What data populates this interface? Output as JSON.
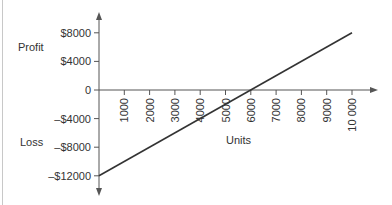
{
  "chart_data": {
    "type": "line",
    "title": "",
    "xlabel": "Units",
    "ylabel_top": "Profit",
    "ylabel_bottom": "Loss",
    "x_ticks": [
      1000,
      2000,
      3000,
      4000,
      5000,
      6000,
      7000,
      8000,
      9000,
      10000
    ],
    "x_tick_labels": [
      "1000",
      "2000",
      "3000",
      "4000",
      "5000",
      "6000",
      "7000",
      "8000",
      "9000",
      "10 000"
    ],
    "y_ticks": [
      8000,
      4000,
      0,
      -4000,
      -8000,
      -12000
    ],
    "y_tick_labels": [
      "$8000",
      "$4000",
      "0",
      "–$4000",
      "–$8000",
      "–$12000"
    ],
    "xlim": [
      0,
      11000
    ],
    "ylim": [
      -14000,
      11000
    ],
    "grid": false,
    "series": [
      {
        "name": "Profit/Loss",
        "x": [
          0,
          10000
        ],
        "y": [
          -12000,
          8000
        ],
        "color": "#333333"
      }
    ],
    "break_even_units": 6000
  }
}
